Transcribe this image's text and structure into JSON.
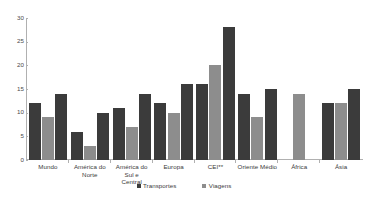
{
  "chart_data": {
    "type": "bar",
    "title": "",
    "subtitle": "",
    "xlabel": "",
    "ylabel": "",
    "ylim": [
      0,
      30
    ],
    "yticks": [
      0,
      5,
      10,
      15,
      20,
      25,
      30
    ],
    "grid": false,
    "legend_position": "bottom-center",
    "categories": [
      "Mundo",
      "América do Norte",
      "América do Sul e Central",
      "Europa",
      "CEI**",
      "Oriente Médio",
      "África",
      "Ásia"
    ],
    "series": [
      {
        "name": "Transportes",
        "color": "#3b3b3b",
        "values": [
          12,
          6,
          11,
          12,
          16,
          14,
          null,
          12
        ]
      },
      {
        "name": "Viagens",
        "color": "#8d8d8d",
        "values": [
          9,
          3,
          7,
          10,
          20,
          9,
          14,
          12
        ]
      },
      {
        "name": "Transportes",
        "color": "#3b3b3b",
        "values": [
          14,
          10,
          14,
          16,
          28,
          15,
          null,
          15
        ]
      }
    ],
    "legend": [
      {
        "label": "Transportes",
        "color": "#3b3b3b"
      },
      {
        "label": "Viagens",
        "color": "#8d8d8d"
      }
    ]
  },
  "axis": {
    "y_tick_labels": [
      "30",
      "25",
      "20",
      "15",
      "10",
      "5",
      "0"
    ]
  },
  "categories_display": [
    {
      "line1": "Mundo",
      "line2": ""
    },
    {
      "line1": "América do",
      "line2": "Norte"
    },
    {
      "line1": "América do Sul e",
      "line2": "Central"
    },
    {
      "line1": "Europa",
      "line2": ""
    },
    {
      "line1": "CEI**",
      "line2": ""
    },
    {
      "line1": "Oriente Médio",
      "line2": ""
    },
    {
      "line1": "África",
      "line2": ""
    },
    {
      "line1": "Ásia",
      "line2": ""
    }
  ],
  "colors": {
    "series_dark": "#3b3b3b",
    "series_gray": "#8d8d8d",
    "axis": "#b0b0b0",
    "text": "#3a3a3a",
    "background": "#ffffff"
  }
}
